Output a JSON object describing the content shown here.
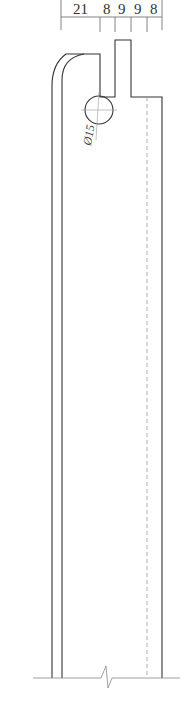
{
  "drawing": {
    "type": "section-profile",
    "dimensions_top": [
      "21",
      "8",
      "9",
      "9",
      "8"
    ],
    "hole_label": "Ø15",
    "colors": {
      "outline": "#333333",
      "dimension": "#555555",
      "center": "#999999"
    }
  }
}
